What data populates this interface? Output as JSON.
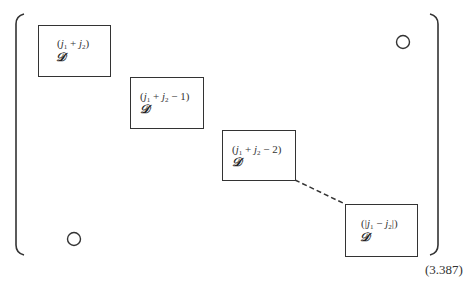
{
  "matrix": {
    "blocks": [
      {
        "label_pre": "(",
        "label_j1": "j",
        "label_s1": "1",
        "label_op": " + ",
        "label_j2": "j",
        "label_s2": "2",
        "label_post": ")",
        "symbol": "𝒟"
      },
      {
        "label_pre": "(",
        "label_j1": "j",
        "label_s1": "1",
        "label_op": " + ",
        "label_j2": "j",
        "label_s2": "2",
        "label_post": " − 1)",
        "symbol": "𝒟"
      },
      {
        "label_pre": "(",
        "label_j1": "j",
        "label_s1": "1",
        "label_op": " + ",
        "label_j2": "j",
        "label_s2": "2",
        "label_post": " − 2)",
        "symbol": "𝒟"
      },
      {
        "label_pre": "(|",
        "label_j1": "j",
        "label_s1": "1",
        "label_op": " − ",
        "label_j2": "j",
        "label_s2": "2",
        "label_post": "|)",
        "symbol": "𝒟"
      }
    ],
    "zero_symbols": [
      "O",
      "O"
    ]
  },
  "equation_number": "(3.387)"
}
